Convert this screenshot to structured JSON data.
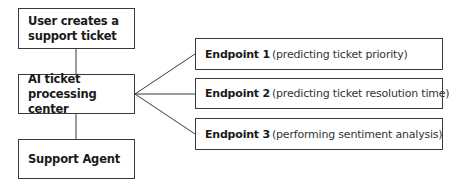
{
  "diagram": {
    "flow": [
      {
        "id": "user",
        "label": "User creates a support ticket"
      },
      {
        "id": "center",
        "label": "AI ticket processing center"
      },
      {
        "id": "agent",
        "label": "Support Agent"
      }
    ],
    "endpoints": [
      {
        "title": "Endpoint 1",
        "desc": "(predicting ticket priority)"
      },
      {
        "title": "Endpoint 2",
        "desc": "(predicting ticket resolution time)"
      },
      {
        "title": "Endpoint 3",
        "desc": "(performing sentiment analysis)"
      }
    ],
    "edges": [
      {
        "from": "user",
        "to": "center"
      },
      {
        "from": "center",
        "to": "agent"
      },
      {
        "from": "center",
        "to": "Endpoint 1"
      },
      {
        "from": "center",
        "to": "Endpoint 2"
      },
      {
        "from": "center",
        "to": "Endpoint 3"
      }
    ],
    "colors": {
      "stroke": "#3a3a3a",
      "background": "#ffffff",
      "text": "#1a1a1a"
    }
  }
}
